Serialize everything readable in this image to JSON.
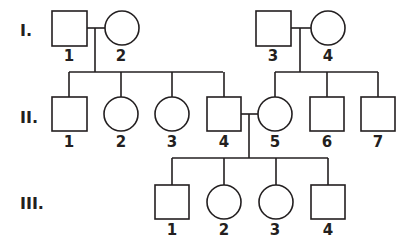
{
  "diagram": {
    "type": "pedigree",
    "generations": [
      {
        "label": "I.",
        "y": 36
      },
      {
        "label": "II.",
        "y": 122
      },
      {
        "label": "III.",
        "y": 209
      }
    ],
    "individuals": [
      {
        "id": "I-1",
        "label": "1",
        "sex": "male",
        "shape": "square",
        "x": 52,
        "y": 11,
        "size": 35
      },
      {
        "id": "I-2",
        "label": "2",
        "sex": "female",
        "shape": "circle",
        "cx": 122,
        "cy": 28,
        "r": 17
      },
      {
        "id": "I-3",
        "label": "3",
        "sex": "male",
        "shape": "square",
        "x": 256,
        "y": 11,
        "size": 35
      },
      {
        "id": "I-4",
        "label": "4",
        "sex": "female",
        "shape": "circle",
        "cx": 328,
        "cy": 28,
        "r": 17
      },
      {
        "id": "II-1",
        "label": "1",
        "sex": "male",
        "shape": "square",
        "x": 52,
        "y": 97,
        "size": 35
      },
      {
        "id": "II-2",
        "label": "2",
        "sex": "female",
        "shape": "circle",
        "cx": 121,
        "cy": 114,
        "r": 17
      },
      {
        "id": "II-3",
        "label": "3",
        "sex": "female",
        "shape": "circle",
        "cx": 172,
        "cy": 114,
        "r": 17
      },
      {
        "id": "II-4",
        "label": "4",
        "sex": "male",
        "shape": "square",
        "x": 207,
        "y": 97,
        "size": 34
      },
      {
        "id": "II-5",
        "label": "5",
        "sex": "female",
        "shape": "circle",
        "cx": 275,
        "cy": 114,
        "r": 17
      },
      {
        "id": "II-6",
        "label": "6",
        "sex": "male",
        "shape": "square",
        "x": 310,
        "y": 97,
        "size": 34
      },
      {
        "id": "II-7",
        "label": "7",
        "sex": "male",
        "shape": "square",
        "x": 361,
        "y": 97,
        "size": 34
      },
      {
        "id": "III-1",
        "label": "1",
        "sex": "male",
        "shape": "square",
        "x": 155,
        "y": 185,
        "size": 34
      },
      {
        "id": "III-2",
        "label": "2",
        "sex": "female",
        "shape": "circle",
        "cx": 224,
        "cy": 202,
        "r": 17
      },
      {
        "id": "III-3",
        "label": "3",
        "sex": "female",
        "shape": "circle",
        "cx": 276,
        "cy": 202,
        "r": 17
      },
      {
        "id": "III-4",
        "label": "4",
        "sex": "male",
        "shape": "square",
        "x": 311,
        "y": 185,
        "size": 34
      }
    ],
    "matings": [
      {
        "partners": [
          "I-1",
          "I-2"
        ],
        "children": [
          "II-1",
          "II-2",
          "II-3",
          "II-4"
        ]
      },
      {
        "partners": [
          "I-3",
          "I-4"
        ],
        "children": [
          "II-5",
          "II-6",
          "II-7"
        ]
      },
      {
        "partners": [
          "II-4",
          "II-5"
        ],
        "children": [
          "III-1",
          "III-2",
          "III-3",
          "III-4"
        ]
      }
    ],
    "colors": {
      "stroke": "#231f20",
      "fill": "#ffffff",
      "background": "#ffffff"
    }
  }
}
